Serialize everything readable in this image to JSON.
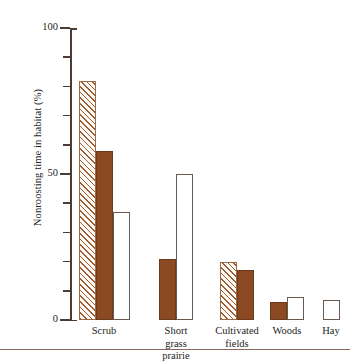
{
  "chart_data": {
    "type": "bar",
    "title": "",
    "xlabel": "",
    "ylabel": "Nonroosting time in habitat (%)",
    "ylim": [
      0,
      100
    ],
    "ytick_labels": [
      "0",
      "50",
      "100"
    ],
    "ytick_values": [
      0,
      50,
      100
    ],
    "minor_tick_step": 10,
    "grid": false,
    "legend_position": "none",
    "categories": [
      "Scrub",
      "Short grass prairie",
      "Cultivated fields",
      "Woods",
      "Hay"
    ],
    "category_lines": [
      [
        "Scrub"
      ],
      [
        "Short",
        "grass",
        "prairie"
      ],
      [
        "Cultivated",
        "fields"
      ],
      [
        "Woods"
      ],
      [
        "Hay"
      ]
    ],
    "series": [
      {
        "name": "hatched",
        "style": "hatched",
        "values": [
          82,
          null,
          20,
          null,
          null
        ]
      },
      {
        "name": "solid",
        "style": "solid-brown",
        "values": [
          58,
          21,
          17,
          6,
          null
        ]
      },
      {
        "name": "open",
        "style": "open-white",
        "values": [
          37,
          50,
          null,
          8,
          7
        ]
      }
    ],
    "bars": [
      {
        "category": "Scrub",
        "style": "hatched",
        "value": 82
      },
      {
        "category": "Scrub",
        "style": "solid-brown",
        "value": 58
      },
      {
        "category": "Scrub",
        "style": "open-white",
        "value": 37
      },
      {
        "category": "Short grass prairie",
        "style": "solid-brown",
        "value": 21
      },
      {
        "category": "Short grass prairie",
        "style": "open-white",
        "value": 50
      },
      {
        "category": "Cultivated fields",
        "style": "hatched",
        "value": 20
      },
      {
        "category": "Cultivated fields",
        "style": "solid-brown",
        "value": 17
      },
      {
        "category": "Woods",
        "style": "solid-brown",
        "value": 6
      },
      {
        "category": "Woods",
        "style": "open-white",
        "value": 8
      },
      {
        "category": "Hay",
        "style": "open-white",
        "value": 7
      }
    ],
    "colors": {
      "solid_fill": "#8c4a22",
      "hatch_line": "#9e5c30",
      "open_fill": "#ffffff",
      "axis": "#4a3b33",
      "text": "#241d1a",
      "rule": "#8a6a5c"
    }
  },
  "ticks": {
    "labeled": [
      {
        "value": 100,
        "label": "100"
      },
      {
        "value": 50,
        "label": "50"
      },
      {
        "value": 0,
        "label": "0"
      }
    ]
  }
}
